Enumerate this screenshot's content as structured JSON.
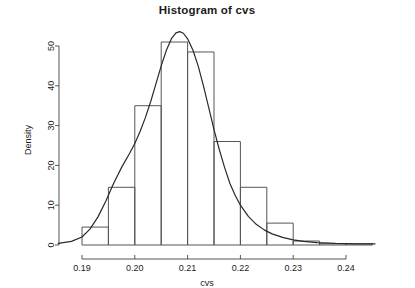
{
  "figure": {
    "title": "Histogram of cvs",
    "background": "#ffffff",
    "foreground": "#1b1b1b"
  },
  "axes": {
    "ylabel": "Density",
    "xlabel": "cvs",
    "x_ticks": [
      "0.19",
      "0.20",
      "0.21",
      "0.22",
      "0.23",
      "0.24"
    ],
    "y_ticks": [
      "0",
      "10",
      "20",
      "30",
      "40",
      "50"
    ]
  },
  "chart_data": {
    "type": "bar",
    "title": "Histogram of cvs",
    "xlabel": "cvs",
    "ylabel": "Density",
    "xlim": [
      0.1855,
      0.2455
    ],
    "ylim": [
      0,
      53.8
    ],
    "grid": false,
    "legend": null,
    "bin_width": 0.005,
    "bin_edges": [
      0.19,
      0.195,
      0.2,
      0.205,
      0.21,
      0.215,
      0.22,
      0.225,
      0.23,
      0.235,
      0.24,
      0.245
    ],
    "values": [
      4.5,
      14.5,
      35.0,
      51.0,
      48.5,
      26.0,
      14.5,
      5.5,
      1.0,
      0.3,
      0.3
    ],
    "categories": [
      "0.190-0.195",
      "0.195-0.200",
      "0.200-0.205",
      "0.205-0.210",
      "0.210-0.215",
      "0.215-0.220",
      "0.220-0.225",
      "0.225-0.230",
      "0.230-0.235",
      "0.235-0.240",
      "0.240-0.245"
    ],
    "bar_fill": "none",
    "bar_edge": "#555555",
    "series": [
      {
        "name": "density-curve",
        "type": "line",
        "color": "#2a2a2a",
        "x": [
          0.1855,
          0.188,
          0.19,
          0.1915,
          0.193,
          0.1945,
          0.196,
          0.1975,
          0.199,
          0.2,
          0.201,
          0.202,
          0.203,
          0.204,
          0.205,
          0.206,
          0.207,
          0.2078,
          0.2085,
          0.2092,
          0.21,
          0.211,
          0.212,
          0.213,
          0.214,
          0.215,
          0.216,
          0.217,
          0.218,
          0.219,
          0.22,
          0.2215,
          0.223,
          0.2245,
          0.226,
          0.228,
          0.23,
          0.232,
          0.2345,
          0.238,
          0.242,
          0.2455
        ],
        "y": [
          0.4,
          0.9,
          2.0,
          4.0,
          7.0,
          11.0,
          15.5,
          19.5,
          23.0,
          25.5,
          28.5,
          32.0,
          36.0,
          40.5,
          45.0,
          49.0,
          52.0,
          53.3,
          53.6,
          53.2,
          51.8,
          49.0,
          45.0,
          40.0,
          34.5,
          29.0,
          24.0,
          19.5,
          15.5,
          12.5,
          10.0,
          7.2,
          5.2,
          3.8,
          2.8,
          1.9,
          1.3,
          0.9,
          0.6,
          0.4,
          0.3,
          0.3
        ]
      }
    ]
  }
}
